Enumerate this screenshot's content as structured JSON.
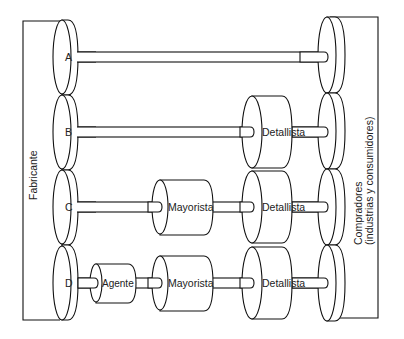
{
  "diagram": {
    "left_label": "Fabricante",
    "right_label_line1": "Compradores",
    "right_label_line2": "(industrias y consumidores)",
    "channels": [
      {
        "id": "A",
        "intermediaries": []
      },
      {
        "id": "B",
        "intermediaries": [
          "Detallista"
        ]
      },
      {
        "id": "C",
        "intermediaries": [
          "Mayorista",
          "Detallista"
        ]
      },
      {
        "id": "D",
        "intermediaries": [
          "Agente",
          "Mayorista",
          "Detallista"
        ]
      }
    ],
    "labels": {
      "A": "A",
      "B": "B",
      "C": "C",
      "D": "D",
      "detallista": "Detallista",
      "mayorista": "Mayorista",
      "agente": "Agente"
    }
  }
}
